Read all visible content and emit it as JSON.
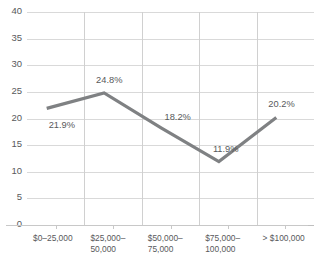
{
  "chart_data": {
    "type": "line",
    "title": "",
    "subtitle": "",
    "xlabel": "",
    "ylabel": "",
    "categories": [
      "$0–25,000",
      "$25,000–\n50,000",
      "$50,000–\n75,000",
      "$75,000–\n100,000",
      "> $100,000"
    ],
    "values": [
      21.9,
      24.8,
      18.2,
      11.9,
      20.2
    ],
    "point_labels": [
      "21.9%",
      "24.8%",
      "18.2%",
      "11.9%",
      "20.2%"
    ],
    "ylim": [
      0,
      40
    ],
    "ytick_values": [
      0,
      5,
      10,
      15,
      20,
      25,
      30,
      35,
      40
    ],
    "ytick_labels": [
      "0",
      "5",
      "10",
      "15",
      "20",
      "25",
      "30",
      "35",
      "40"
    ],
    "grid": {
      "horizontal": true,
      "vertical": true
    },
    "legend": {
      "visible": false,
      "position": "none"
    },
    "series_color": "#7f8183",
    "grid_color": "#d9d9d9",
    "text_color": "#58595b"
  }
}
